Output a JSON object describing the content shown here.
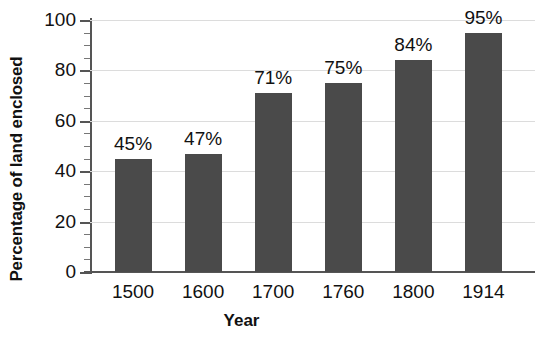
{
  "chart_data": {
    "type": "bar",
    "title": "",
    "xlabel": "Year",
    "ylabel": "Percentage of land enclosed",
    "categories": [
      "1500",
      "1600",
      "1700",
      "1760",
      "1800",
      "1914"
    ],
    "values": [
      45,
      47,
      71,
      75,
      84,
      95
    ],
    "data_labels": [
      "45%",
      "47%",
      "71%",
      "75%",
      "84%",
      "95%"
    ],
    "ylim": [
      0,
      100
    ],
    "ytick_labels": [
      "0",
      "20",
      "40",
      "60",
      "80",
      "100"
    ],
    "ytick_values": [
      0,
      20,
      40,
      60,
      80,
      100
    ],
    "minor_tick_step": 5,
    "grid": true,
    "legend": false,
    "colors": {
      "bar": "#4a4a4a",
      "gridline": "#dcdcdc",
      "axis": "#555555",
      "text": "#111111",
      "background": "#ffffff"
    }
  }
}
